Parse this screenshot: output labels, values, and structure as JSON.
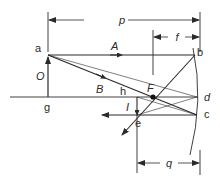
{
  "diagram": {
    "labels": {
      "p": "p",
      "f": "f",
      "q": "q",
      "a": "a",
      "b": "b",
      "c": "c",
      "d": "d",
      "e": "e",
      "g": "g",
      "h": "h",
      "O": "O",
      "I": "I",
      "F": "F",
      "A": "A",
      "B": "B"
    },
    "colors": {
      "line": "#2a2a2a",
      "background": "#ffffff"
    }
  }
}
